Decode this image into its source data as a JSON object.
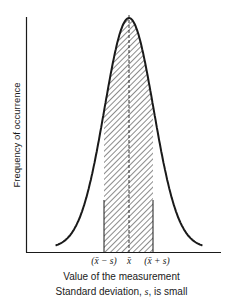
{
  "chart_data": {
    "type": "line",
    "title": "",
    "xlabel": "Value of the measurement",
    "ylabel": "Frequency of occurrence",
    "caption": "Standard deviation, s, is small",
    "caption_parts": {
      "prefix": "Standard deviation, ",
      "symbol": "s",
      "suffix": ", is small"
    },
    "distribution": "normal",
    "x_tick_labels": [
      "(x̄ − s)",
      "x̄",
      "(x̄ + s)"
    ],
    "x_ticks_in_sd": [
      -1,
      0,
      1
    ],
    "shaded_region": {
      "from_sd": -1,
      "to_sd": 1,
      "pattern": "diagonal-hatch"
    },
    "mean_line": "dashed",
    "grid": false,
    "legend": null,
    "curve_extent_sd": [
      -3,
      3
    ]
  },
  "colors": {
    "line": "#1a1a1a",
    "background": "#ffffff"
  }
}
